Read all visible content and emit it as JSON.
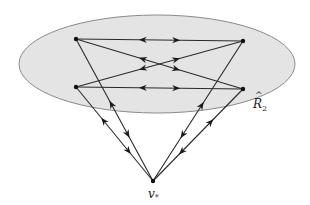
{
  "diagram": {
    "region": {
      "label": "R",
      "label_hat": "^",
      "label_sub": "2",
      "cx": 157,
      "cy": 64,
      "rx": 138,
      "ry": 49,
      "fill": "#e4e4e4"
    },
    "nodes": [
      {
        "id": "tl",
        "x": 76,
        "y": 39
      },
      {
        "id": "tr",
        "x": 243,
        "y": 41
      },
      {
        "id": "bl",
        "x": 76,
        "y": 87
      },
      {
        "id": "br",
        "x": 243,
        "y": 89
      },
      {
        "id": "vstar",
        "x": 153,
        "y": 181,
        "label": "v",
        "label_sub": "*"
      }
    ],
    "edges": [
      {
        "from": "tl",
        "to": "tr",
        "bidirectional": true
      },
      {
        "from": "bl",
        "to": "br",
        "bidirectional": true
      },
      {
        "from": "tl",
        "to": "br",
        "bidirectional": true
      },
      {
        "from": "bl",
        "to": "tr",
        "bidirectional": true
      },
      {
        "from": "tl",
        "to": "vstar",
        "bidirectional": true
      },
      {
        "from": "bl",
        "to": "vstar",
        "bidirectional": true
      },
      {
        "from": "tr",
        "to": "vstar",
        "bidirectional": true
      },
      {
        "from": "br",
        "to": "vstar",
        "bidirectional": true
      }
    ]
  }
}
